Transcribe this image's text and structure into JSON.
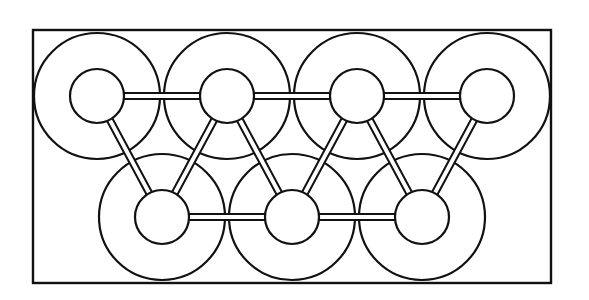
{
  "diagram": {
    "title": "",
    "frame": {
      "x": 33,
      "y": 30,
      "width": 518,
      "height": 253
    },
    "style": {
      "stroke_color": "#111111",
      "background": "#ffffff",
      "rod_width": 8,
      "rod_inner_width": 4
    },
    "rings": {
      "outer_radius": 63,
      "inner_radius": 27,
      "top_row": [
        {
          "id": "T1",
          "cx": 97,
          "cy": 96
        },
        {
          "id": "T2",
          "cx": 227,
          "cy": 96
        },
        {
          "id": "T3",
          "cx": 357,
          "cy": 96
        },
        {
          "id": "T4",
          "cx": 487,
          "cy": 96
        }
      ],
      "bottom_row": [
        {
          "id": "B1",
          "cx": 162,
          "cy": 217
        },
        {
          "id": "B2",
          "cx": 292,
          "cy": 217
        },
        {
          "id": "B3",
          "cx": 422,
          "cy": 217
        }
      ]
    },
    "rods": [
      {
        "from": "T1",
        "to": "T2"
      },
      {
        "from": "T2",
        "to": "T3"
      },
      {
        "from": "T3",
        "to": "T4"
      },
      {
        "from": "B1",
        "to": "B2"
      },
      {
        "from": "B2",
        "to": "B3"
      },
      {
        "from": "T1",
        "to": "B1"
      },
      {
        "from": "T2",
        "to": "B1"
      },
      {
        "from": "T2",
        "to": "B2"
      },
      {
        "from": "T3",
        "to": "B2"
      },
      {
        "from": "T3",
        "to": "B3"
      },
      {
        "from": "T4",
        "to": "B3"
      }
    ]
  }
}
